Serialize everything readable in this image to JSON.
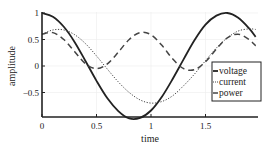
{
  "chart_data": {
    "type": "line",
    "title": "",
    "xlabel": "time",
    "ylabel": "amplitude",
    "xlim": [
      0,
      1.96
    ],
    "ylim": [
      -0.97,
      1.0
    ],
    "grid": true,
    "legend_position": "lower right (inside)",
    "x_ticks": [
      0,
      0.5,
      1,
      1.5
    ],
    "x_tick_labels": [
      "0",
      "0.5",
      "1",
      "1.5"
    ],
    "y_ticks": [
      1,
      0.5,
      0,
      -0.5
    ],
    "y_tick_labels": [
      "1",
      "0.5",
      "0",
      "−0.5"
    ],
    "x": [
      0,
      0.1,
      0.2,
      0.3,
      0.4,
      0.5,
      0.6,
      0.7,
      0.8,
      0.9,
      1.0,
      1.1,
      1.2,
      1.3,
      1.4,
      1.5,
      1.6,
      1.7,
      1.8,
      1.9,
      1.96
    ],
    "series": [
      {
        "name": "voltage",
        "style": "solid",
        "color": "#222222",
        "values": [
          1.0,
          0.93,
          0.74,
          0.45,
          0.09,
          -0.28,
          -0.61,
          -0.85,
          -0.99,
          -0.98,
          -0.84,
          -0.58,
          -0.24,
          0.13,
          0.49,
          0.78,
          0.95,
          1.0,
          0.91,
          0.71,
          0.55
        ]
      },
      {
        "name": "current",
        "style": "dotted",
        "color": "#444444",
        "values": [
          0.6,
          0.68,
          0.68,
          0.59,
          0.42,
          0.19,
          -0.06,
          -0.3,
          -0.5,
          -0.64,
          -0.7,
          -0.67,
          -0.56,
          -0.37,
          -0.15,
          0.1,
          0.34,
          0.53,
          0.66,
          0.7,
          0.69
        ]
      },
      {
        "name": "power",
        "style": "dashed",
        "color": "#444444",
        "values": [
          0.6,
          0.63,
          0.5,
          0.27,
          0.04,
          -0.05,
          0.04,
          0.26,
          0.5,
          0.63,
          0.59,
          0.39,
          0.13,
          -0.05,
          -0.07,
          0.08,
          0.32,
          0.53,
          0.6,
          0.5,
          0.38
        ]
      }
    ]
  }
}
